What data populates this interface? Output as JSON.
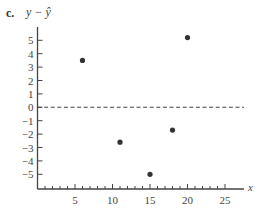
{
  "panel_label": "c.",
  "chart_data": {
    "type": "scatter",
    "title": "",
    "xlabel": "x",
    "ylabel": "y − ŷ",
    "xlim": [
      0,
      27
    ],
    "ylim": [
      -6,
      5.7
    ],
    "x_ticks": [
      5,
      10,
      15,
      20,
      25
    ],
    "x_minor_step": 1,
    "y_ticks": [
      5,
      4,
      3,
      2,
      1,
      0,
      -1,
      -2,
      -3,
      -4,
      -5
    ],
    "reference_line": {
      "y": 0,
      "style": "dashed"
    },
    "grid": false,
    "legend": null,
    "series": [
      {
        "name": "residuals",
        "points": [
          {
            "x": 6,
            "y": 3.5
          },
          {
            "x": 11,
            "y": -2.6
          },
          {
            "x": 15,
            "y": -5.0
          },
          {
            "x": 18,
            "y": -1.7
          },
          {
            "x": 20,
            "y": 5.2
          }
        ]
      }
    ],
    "colors": {
      "axis": "#444444",
      "point": "#333333",
      "text": "#444444"
    }
  }
}
